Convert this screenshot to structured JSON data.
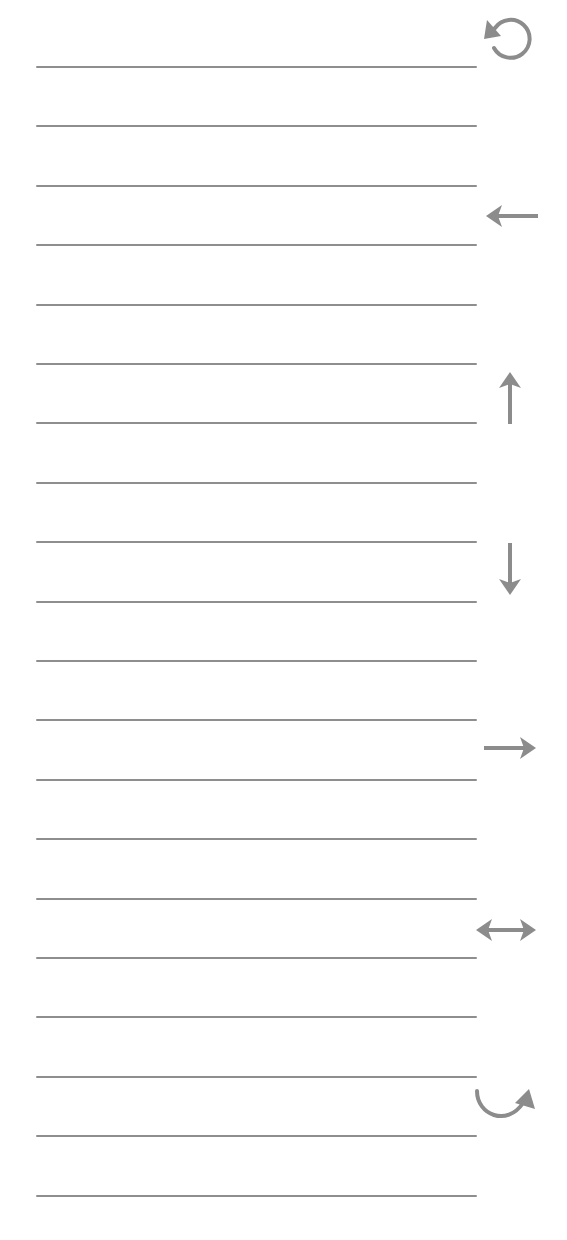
{
  "page": {
    "background": "#ffffff",
    "line_color": "#8e8e8e",
    "icon_color": "#8c8c8c"
  },
  "ruled_lines": {
    "count": 20,
    "x_start": 36,
    "x_end": 477,
    "first_y": 67,
    "spacing": 59.4
  },
  "toolbar": {
    "icons": [
      {
        "name": "rotate-counterclockwise-icon",
        "label": "Rotate counterclockwise",
        "symbol": "⟲",
        "x": 481,
        "y": 12,
        "w": 54,
        "h": 52
      },
      {
        "name": "arrow-left-icon",
        "label": "Move left",
        "symbol": "←",
        "x": 484,
        "y": 203,
        "w": 56,
        "h": 26
      },
      {
        "name": "arrow-up-icon",
        "label": "Move up",
        "symbol": "↑",
        "x": 497,
        "y": 370,
        "w": 26,
        "h": 54
      },
      {
        "name": "arrow-down-icon",
        "label": "Move down",
        "symbol": "↓",
        "x": 497,
        "y": 543,
        "w": 26,
        "h": 54
      },
      {
        "name": "arrow-right-icon",
        "label": "Move right",
        "symbol": "→",
        "x": 482,
        "y": 735,
        "w": 56,
        "h": 26
      },
      {
        "name": "arrow-left-right-icon",
        "label": "Flip horizontal",
        "symbol": "↔",
        "x": 474,
        "y": 917,
        "w": 64,
        "h": 26
      },
      {
        "name": "curved-arrow-clockwise-icon",
        "label": "Rotate clockwise",
        "symbol": "↷",
        "x": 473,
        "y": 1087,
        "w": 64,
        "h": 42
      }
    ]
  }
}
